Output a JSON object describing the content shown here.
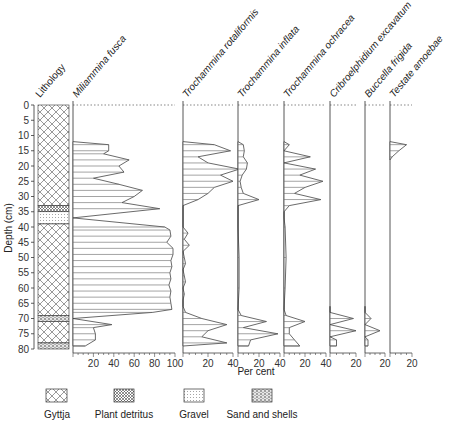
{
  "chart_data": {
    "type": "area",
    "title": "",
    "ylabel": "Depth (cm)",
    "xlabel": "Per cent",
    "ylim": [
      0,
      80
    ],
    "y_ticks": [
      0,
      5,
      10,
      15,
      20,
      25,
      30,
      35,
      40,
      45,
      50,
      55,
      60,
      65,
      70,
      75,
      80
    ],
    "lithology": {
      "label": "Lithology",
      "units": [
        {
          "type": "Gyttja",
          "from": 0,
          "to": 33
        },
        {
          "type": "Plant detritus",
          "from": 33,
          "to": 35
        },
        {
          "type": "Gravel",
          "from": 35,
          "to": 39
        },
        {
          "type": "Gyttja",
          "from": 39,
          "to": 69
        },
        {
          "type": "Sand and shells",
          "from": 69,
          "to": 71
        },
        {
          "type": "Gyttja",
          "from": 71,
          "to": 78
        },
        {
          "type": "Sand and shells",
          "from": 78,
          "to": 80
        }
      ]
    },
    "series": [
      {
        "name": "Miliammina fusca",
        "max": 100,
        "ticks": [
          20,
          40,
          60,
          80,
          100
        ],
        "depths": [
          12,
          13,
          15,
          16,
          18,
          20,
          22,
          24,
          26,
          28,
          30,
          32,
          34,
          37,
          40,
          41,
          43,
          45,
          47,
          49,
          51,
          53,
          55,
          57,
          59,
          61,
          63,
          65,
          67,
          68,
          70,
          72,
          73,
          75,
          77,
          79
        ],
        "values": [
          0,
          35,
          35,
          30,
          55,
          45,
          50,
          20,
          45,
          68,
          60,
          48,
          85,
          0,
          90,
          95,
          96,
          92,
          98,
          98,
          96,
          97,
          95,
          96,
          94,
          96,
          95,
          96,
          97,
          78,
          0,
          38,
          20,
          22,
          22,
          12
        ]
      },
      {
        "name": "Trochammina rotaliformis",
        "max": 40,
        "ticks": [
          20,
          40
        ],
        "depths": [
          12,
          13,
          15,
          17,
          19,
          21,
          23,
          25,
          27,
          29,
          31,
          33,
          40,
          42,
          44,
          46,
          48,
          50,
          52,
          54,
          56,
          58,
          60,
          62,
          64,
          66,
          68,
          70,
          72,
          74,
          76,
          78,
          79
        ],
        "values": [
          0,
          25,
          38,
          12,
          20,
          45,
          30,
          40,
          25,
          20,
          12,
          0,
          0,
          4,
          1,
          5,
          0,
          1,
          2,
          0,
          1,
          2,
          0,
          1,
          0,
          0,
          2,
          15,
          35,
          20,
          15,
          35,
          0
        ]
      },
      {
        "name": "Trochammina inflata",
        "max": 40,
        "ticks": [
          20,
          40
        ],
        "depths": [
          12,
          13,
          15,
          17,
          19,
          21,
          23,
          25,
          27,
          29,
          31,
          33,
          40,
          50,
          60,
          67,
          69,
          71,
          73,
          75,
          77,
          79
        ],
        "values": [
          0,
          5,
          6,
          5,
          9,
          8,
          4,
          2,
          3,
          5,
          20,
          0,
          0,
          1,
          1,
          0,
          3,
          27,
          5,
          38,
          12,
          10
        ]
      },
      {
        "name": "Trochammina ochracea",
        "max": 40,
        "ticks": [
          20,
          40
        ],
        "depths": [
          12,
          13,
          15,
          17,
          19,
          21,
          23,
          25,
          27,
          29,
          31,
          33,
          35,
          37,
          40,
          50,
          60,
          67,
          69,
          71,
          73,
          75,
          77,
          79
        ],
        "values": [
          0,
          5,
          0,
          25,
          0,
          30,
          15,
          37,
          20,
          10,
          35,
          5,
          0,
          0,
          1,
          2,
          1,
          0,
          2,
          20,
          5,
          5,
          10,
          15
        ]
      },
      {
        "name": "Cribroelphidium excavatum",
        "max": 20,
        "ticks": [
          20
        ],
        "depths": [
          66,
          68,
          70,
          72,
          74,
          76,
          77,
          79
        ],
        "values": [
          0,
          0,
          18,
          0,
          20,
          0,
          5,
          5
        ]
      },
      {
        "name": "Buccella frigida",
        "max": 20,
        "ticks": [
          20
        ],
        "depths": [
          66,
          68,
          70,
          72,
          74,
          76,
          77,
          79
        ],
        "values": [
          0,
          0,
          6,
          0,
          15,
          0,
          3,
          3
        ]
      },
      {
        "name": "Testate amoebae",
        "max": 20,
        "ticks": [
          20
        ],
        "depths": [
          12,
          13,
          15,
          17,
          18
        ],
        "values": [
          0,
          15,
          8,
          2,
          0
        ]
      }
    ],
    "legend": [
      "Gyttja",
      "Plant detritus",
      "Gravel",
      "Sand and shells"
    ],
    "grid": false
  },
  "labels": {
    "lithology": "Lithology",
    "ylabel": "Depth (cm)",
    "xlabel": "Per cent",
    "legend": {
      "gyttja": "Gyttja",
      "plant": "Plant detritus",
      "gravel": "Gravel",
      "sand": "Sand and shells"
    }
  }
}
